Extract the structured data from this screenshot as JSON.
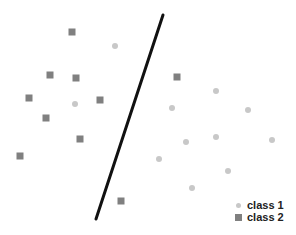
{
  "chart_data": {
    "type": "scatter",
    "title": "",
    "xlabel": "",
    "ylabel": "",
    "grid": false,
    "axes_visible": false,
    "legend_position": "bottom-right",
    "series": [
      {
        "name": "class 1",
        "marker": "circle",
        "color": "#c8c8c8",
        "points": [
          [
            115,
            46
          ],
          [
            75,
            104
          ],
          [
            216,
            91
          ],
          [
            172,
            108
          ],
          [
            248,
            110
          ],
          [
            186,
            142
          ],
          [
            216,
            137
          ],
          [
            272,
            140
          ],
          [
            159,
            159
          ],
          [
            228,
            171
          ],
          [
            192,
            188
          ]
        ]
      },
      {
        "name": "class 2",
        "marker": "square",
        "color": "#808080",
        "points": [
          [
            72,
            32
          ],
          [
            50,
            75
          ],
          [
            76,
            78
          ],
          [
            29,
            98
          ],
          [
            100,
            100
          ],
          [
            46,
            118
          ],
          [
            80,
            139
          ],
          [
            20,
            156
          ],
          [
            121,
            201
          ],
          [
            177,
            77
          ]
        ]
      }
    ],
    "decision_boundary": {
      "x1": 163,
      "y1": 15,
      "x2": 96,
      "y2": 219,
      "color": "#111111",
      "width": 3
    }
  },
  "legend": {
    "items": [
      {
        "label": "class 1",
        "marker": "circle"
      },
      {
        "label": "class 2",
        "marker": "square"
      }
    ]
  }
}
